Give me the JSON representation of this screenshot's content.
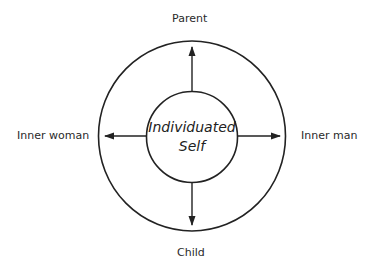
{
  "diagram": {
    "center": {
      "line1": "Individuated",
      "line2": "Self"
    },
    "labels": {
      "top": "Parent",
      "bottom": "Child",
      "left": "Inner woman",
      "right": "Inner man"
    },
    "colors": {
      "stroke": "#222222",
      "text": "#2a2a2a",
      "background": "#ffffff"
    }
  }
}
